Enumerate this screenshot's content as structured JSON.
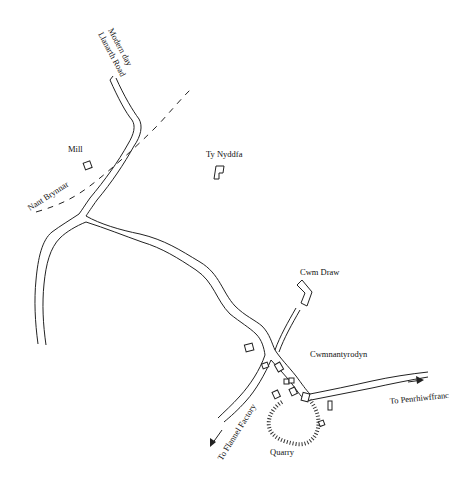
{
  "map": {
    "labels": {
      "modern_road_line1": "Modern day",
      "modern_road_line2": "Llanarth Road",
      "mill": "Mill",
      "nant_brynnar": "Nant Brynnar",
      "ty_nyddfa": "Ty Nyddfa",
      "cwm_draw": "Cwm Draw",
      "cwmnantyrodyn": "Cwmnantyrodyn",
      "to_penrhiwffranc": "To Penrhiwffranc",
      "to_flannel_factory": "To Flannel Factory",
      "quarry": "Quarry"
    },
    "features": {
      "roads": [
        "Modern day Llanarth Road",
        "Main road to Cwmnantyrodyn",
        "Western branch",
        "Road to Cwm Draw",
        "Road to Penrhiwffranc",
        "Road to Flannel Factory"
      ],
      "stream": "Nant Brynnar",
      "quarry": "Quarry",
      "buildings": [
        "Mill",
        "Ty Nyddfa",
        "Cwm Draw",
        "Cwmnantyrodyn cluster"
      ]
    }
  }
}
